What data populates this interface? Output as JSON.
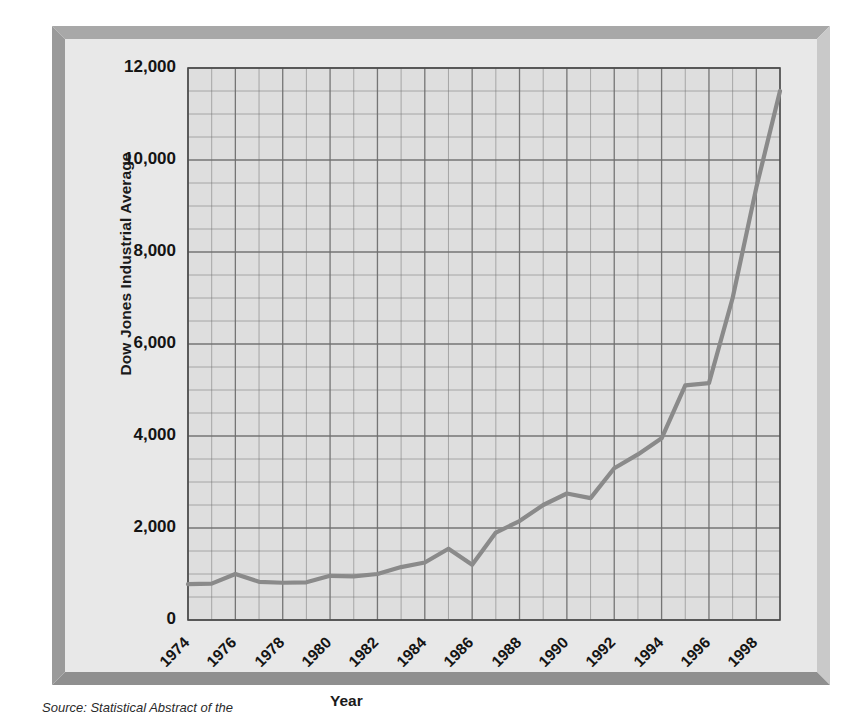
{
  "figure": {
    "source_note": "Source: Statistical Abstract of the",
    "frame_color": "#a8a8a8",
    "plot_background": "#dedede",
    "line_color": "#8a8a8a",
    "grid_color": "#6f6f6f"
  },
  "chart_data": {
    "type": "line",
    "title": "",
    "xlabel": "Year",
    "ylabel": "Dow Jones Industrial Average",
    "xlim": [
      1974,
      1999
    ],
    "ylim": [
      0,
      12000
    ],
    "grid": true,
    "legend": "none",
    "ytick_labels": [
      "12,000",
      "10,000",
      "8,000",
      "6,000",
      "4,000",
      "2,000",
      "0"
    ],
    "ytick_values": [
      12000,
      10000,
      8000,
      6000,
      4000,
      2000,
      0
    ],
    "xtick_labels": [
      "1974",
      "1976",
      "1978",
      "1980",
      "1982",
      "1984",
      "1986",
      "1988",
      "1990",
      "1992",
      "1994",
      "1996",
      "1998"
    ],
    "xtick_values": [
      1974,
      1976,
      1978,
      1980,
      1982,
      1984,
      1986,
      1988,
      1990,
      1992,
      1994,
      1996,
      1998
    ],
    "y_minor_step": 500,
    "x_minor_step": 1,
    "series": [
      {
        "name": "Dow Jones Industrial Average",
        "x": [
          1974,
          1975,
          1976,
          1977,
          1978,
          1979,
          1980,
          1981,
          1982,
          1983,
          1984,
          1985,
          1986,
          1987,
          1988,
          1989,
          1990,
          1991,
          1992,
          1993,
          1994,
          1995,
          1996,
          1997,
          1998,
          1999
        ],
        "values": [
          780,
          790,
          1000,
          830,
          810,
          820,
          960,
          950,
          1000,
          1150,
          1250,
          1550,
          1200,
          1900,
          2150,
          2500,
          2750,
          2650,
          3300,
          3600,
          3950,
          5100,
          5150,
          7000,
          9400,
          11500
        ]
      }
    ]
  }
}
